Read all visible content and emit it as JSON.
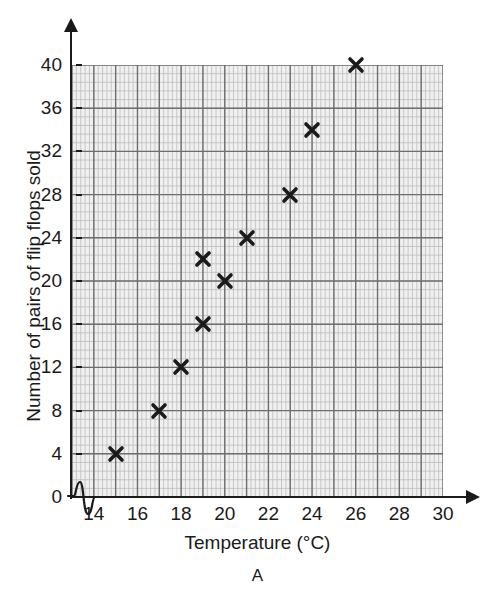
{
  "figure": {
    "caption": "A"
  },
  "chart_data": {
    "type": "scatter",
    "title": "",
    "xlabel": "Temperature (°C)",
    "ylabel": "Number of pairs of flip flops sold",
    "xlim": [
      13,
      30
    ],
    "ylim": [
      0,
      40
    ],
    "x_tick_labels": [
      "14",
      "16",
      "18",
      "20",
      "22",
      "24",
      "26",
      "28",
      "30"
    ],
    "x_tick_values": [
      14,
      16,
      18,
      20,
      22,
      24,
      26,
      28,
      30
    ],
    "y_tick_labels": [
      "0",
      "4",
      "8",
      "12",
      "16",
      "20",
      "24",
      "28",
      "32",
      "36",
      "40"
    ],
    "y_tick_values": [
      0,
      4,
      8,
      12,
      16,
      20,
      24,
      28,
      32,
      36,
      40
    ],
    "grid": true,
    "grid_major_step_x": 1,
    "grid_major_step_y": 4,
    "grid_minor_step_x": 0.2,
    "grid_minor_step_y": 0.8,
    "legend": null,
    "axis_break": "y-axis-origin-squiggle",
    "marker_style": "x-cross",
    "marker_color": "#1a1a1a",
    "points": [
      {
        "x": 15,
        "y": 4
      },
      {
        "x": 17,
        "y": 8
      },
      {
        "x": 18,
        "y": 12
      },
      {
        "x": 19,
        "y": 16
      },
      {
        "x": 19,
        "y": 22
      },
      {
        "x": 20,
        "y": 20
      },
      {
        "x": 21,
        "y": 24
      },
      {
        "x": 23,
        "y": 28
      },
      {
        "x": 24,
        "y": 34
      },
      {
        "x": 26,
        "y": 40
      }
    ]
  },
  "colors": {
    "plot_background": "#f0f0f0",
    "major_gridline": "#6e6e6e",
    "minor_gridline": "#bdbdbd",
    "axis": "#1a1a1a",
    "text": "#1a1a1a"
  }
}
